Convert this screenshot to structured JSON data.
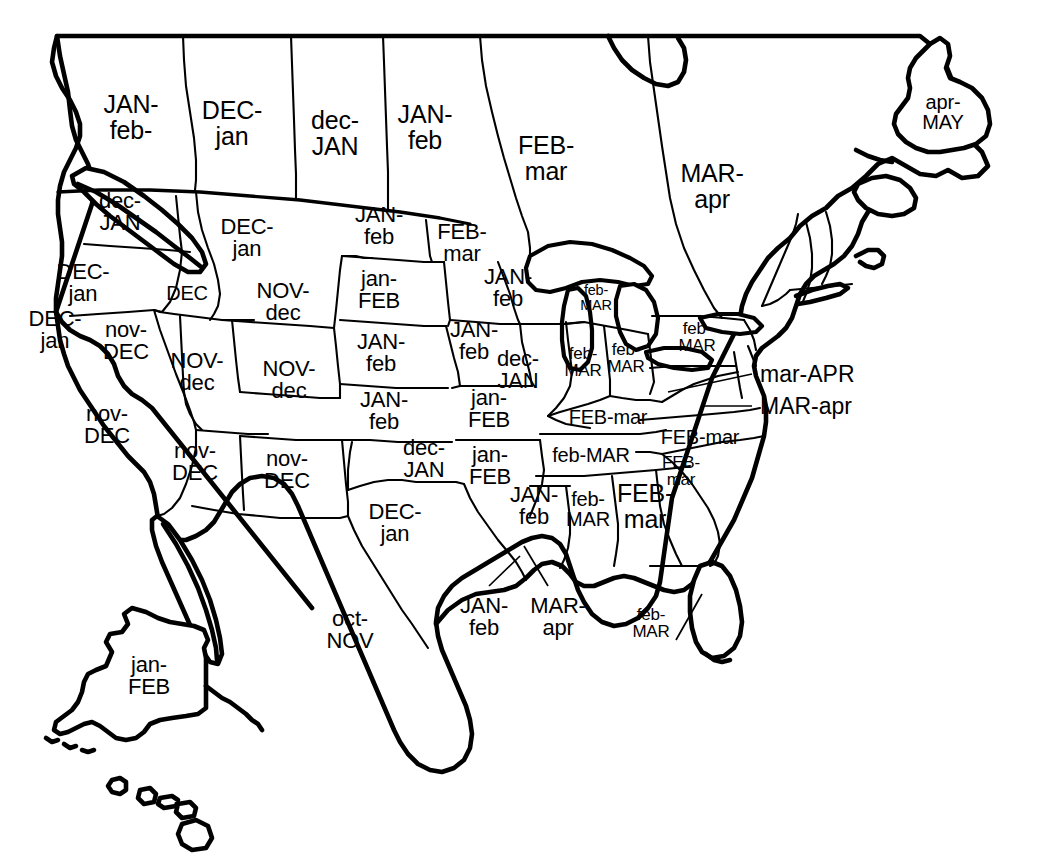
{
  "map": {
    "title": "North America Seasonal Month Map",
    "background_color": "#ffffff",
    "ink_color": "#000000",
    "width": 1044,
    "height": 865,
    "legend_note": "Uppercase month = primary period; lowercase month = secondary period"
  },
  "regions": [
    {
      "id": "british-columbia",
      "lines": [
        "JAN-",
        "feb-"
      ],
      "x": 131,
      "y": 117,
      "size": "sz-xl"
    },
    {
      "id": "alberta",
      "lines": [
        "DEC-",
        "jan"
      ],
      "x": 232,
      "y": 123,
      "size": "sz-xl"
    },
    {
      "id": "saskatchewan",
      "lines": [
        "dec-",
        "JAN"
      ],
      "x": 335,
      "y": 133,
      "size": "sz-xl"
    },
    {
      "id": "manitoba",
      "lines": [
        "JAN-",
        "feb"
      ],
      "x": 425,
      "y": 127,
      "size": "sz-xl"
    },
    {
      "id": "ontario",
      "lines": [
        "FEB-",
        "mar"
      ],
      "x": 546,
      "y": 158,
      "size": "sz-xl"
    },
    {
      "id": "quebec",
      "lines": [
        "MAR-",
        "apr"
      ],
      "x": 712,
      "y": 186,
      "size": "sz-xl"
    },
    {
      "id": "newfoundland",
      "lines": [
        "apr-",
        "MAY"
      ],
      "x": 943,
      "y": 112,
      "size": "sz-md"
    },
    {
      "id": "washington",
      "lines": [
        "dec-",
        "JAN"
      ],
      "x": 120,
      "y": 212,
      "size": "sz-lg"
    },
    {
      "id": "montana",
      "lines": [
        "DEC-",
        "jan"
      ],
      "x": 247,
      "y": 238,
      "size": "sz-lg"
    },
    {
      "id": "north-dakota",
      "lines": [
        "JAN-",
        "feb"
      ],
      "x": 379,
      "y": 226,
      "size": "sz-lg"
    },
    {
      "id": "minnesota",
      "lines": [
        "FEB-",
        "mar"
      ],
      "x": 462,
      "y": 243,
      "size": "sz-lg"
    },
    {
      "id": "oregon",
      "lines": [
        "DEC-",
        "jan"
      ],
      "x": 83,
      "y": 283,
      "size": "sz-lg"
    },
    {
      "id": "idaho-south",
      "lines": [
        "DEC"
      ],
      "x": 187,
      "y": 293,
      "size": "sz-md"
    },
    {
      "id": "south-dakota",
      "lines": [
        "jan-",
        "FEB"
      ],
      "x": 379,
      "y": 290,
      "size": "sz-lg"
    },
    {
      "id": "wisconsin",
      "lines": [
        "JAN-",
        "feb"
      ],
      "x": 508,
      "y": 288,
      "size": "sz-lg"
    },
    {
      "id": "michigan-upper",
      "lines": [
        "feb-",
        "MAR"
      ],
      "x": 596,
      "y": 298,
      "size": "sz-xs"
    },
    {
      "id": "wyoming",
      "lines": [
        "NOV-",
        "dec"
      ],
      "x": 283,
      "y": 302,
      "size": "sz-lg"
    },
    {
      "id": "california-north",
      "lines": [
        "DEC-",
        "jan"
      ],
      "x": 55,
      "y": 330,
      "size": "sz-lg"
    },
    {
      "id": "nevada",
      "lines": [
        "nov-",
        "DEC"
      ],
      "x": 126,
      "y": 341,
      "size": "sz-lg"
    },
    {
      "id": "nebraska",
      "lines": [
        "JAN-",
        "feb"
      ],
      "x": 381,
      "y": 353,
      "size": "sz-lg"
    },
    {
      "id": "iowa",
      "lines": [
        "JAN-",
        "feb"
      ],
      "x": 474,
      "y": 341,
      "size": "sz-lg"
    },
    {
      "id": "utah",
      "lines": [
        "NOV-",
        "dec"
      ],
      "x": 197,
      "y": 372,
      "size": "sz-lg"
    },
    {
      "id": "colorado",
      "lines": [
        "NOV-",
        "dec"
      ],
      "x": 289,
      "y": 380,
      "size": "sz-lg"
    },
    {
      "id": "illinois",
      "lines": [
        "dec-",
        "JAN"
      ],
      "x": 518,
      "y": 370,
      "size": "sz-lg"
    },
    {
      "id": "indiana",
      "lines": [
        "feb-",
        "MAR"
      ],
      "x": 583,
      "y": 362,
      "size": "sz-sm"
    },
    {
      "id": "ohio",
      "lines": [
        "feb-",
        "MAR"
      ],
      "x": 626,
      "y": 358,
      "size": "sz-sm"
    },
    {
      "id": "pennsylvania",
      "lines": [
        "feb-",
        "MAR"
      ],
      "x": 697,
      "y": 337,
      "size": "sz-sm"
    },
    {
      "id": "kansas",
      "lines": [
        "JAN-",
        "feb"
      ],
      "x": 384,
      "y": 411,
      "size": "sz-lg"
    },
    {
      "id": "missouri",
      "lines": [
        "jan-",
        "FEB"
      ],
      "x": 489,
      "y": 409,
      "size": "sz-lg"
    },
    {
      "id": "kentucky",
      "lines": [
        "FEB-mar"
      ],
      "x": 608,
      "y": 417,
      "size": "sz-md"
    },
    {
      "id": "arizona",
      "lines": [
        "nov-",
        "DEC"
      ],
      "x": 195,
      "y": 462,
      "size": "sz-lg"
    },
    {
      "id": "new-mexico",
      "lines": [
        "nov-",
        "DEC"
      ],
      "x": 287,
      "y": 470,
      "size": "sz-lg"
    },
    {
      "id": "oklahoma",
      "lines": [
        "dec-",
        "JAN"
      ],
      "x": 424,
      "y": 459,
      "size": "sz-lg"
    },
    {
      "id": "arkansas",
      "lines": [
        "jan-",
        "FEB"
      ],
      "x": 490,
      "y": 466,
      "size": "sz-lg"
    },
    {
      "id": "tennessee",
      "lines": [
        "feb-MAR"
      ],
      "x": 591,
      "y": 455,
      "size": "sz-md"
    },
    {
      "id": "north-carolina",
      "lines": [
        "FEB-mar"
      ],
      "x": 700,
      "y": 437,
      "size": "sz-md"
    },
    {
      "id": "south-carolina",
      "lines": [
        "FEB-",
        "mar"
      ],
      "x": 681,
      "y": 471,
      "size": "sz-sm"
    },
    {
      "id": "california-south",
      "lines": [
        "nov-",
        "DEC"
      ],
      "x": 107,
      "y": 425,
      "size": "sz-lg"
    },
    {
      "id": "texas",
      "lines": [
        "DEC-",
        "jan"
      ],
      "x": 395,
      "y": 523,
      "size": "sz-lg"
    },
    {
      "id": "louisiana",
      "lines": [
        "JAN-",
        "feb"
      ],
      "x": 534,
      "y": 506,
      "size": "sz-lg"
    },
    {
      "id": "mississippi",
      "lines": [
        "feb-",
        "MAR"
      ],
      "x": 588,
      "y": 509,
      "size": "sz-md"
    },
    {
      "id": "alabama",
      "lines": [
        "FEB-",
        "mar"
      ],
      "x": 645,
      "y": 506,
      "size": "sz-xl"
    },
    {
      "id": "mexico",
      "lines": [
        "oct-",
        "NOV"
      ],
      "x": 350,
      "y": 630,
      "size": "sz-lg"
    },
    {
      "id": "alaska",
      "lines": [
        "jan-",
        "FEB"
      ],
      "x": 149,
      "y": 676,
      "size": "sz-lg"
    }
  ],
  "callouts": [
    {
      "id": "maryland",
      "label": "mar-APR",
      "text_x": 760,
      "text_y": 374,
      "leader": "M 752 374 L 668 392"
    },
    {
      "id": "delaware",
      "label": "MAR-apr",
      "text_x": 760,
      "text_y": 406,
      "leader": "M 752 406 L 705 406"
    },
    {
      "id": "texas-gulf",
      "lines": [
        "JAN-",
        "feb"
      ],
      "label": "JAN-feb",
      "text_x": 484,
      "text_y": 618,
      "leader": "M 490 586 L 518 556"
    },
    {
      "id": "louisiana-gulf",
      "lines": [
        "MAR-",
        "apr"
      ],
      "label": "MAR-apr",
      "text_x": 556,
      "text_y": 618,
      "leader": "M 546 586 L 524 548"
    },
    {
      "id": "florida",
      "lines": [
        "feb-",
        "MAR"
      ],
      "label": "feb-MAR",
      "text_x": 651,
      "text_y": 623,
      "leader": "M 676 640 L 700 596"
    }
  ],
  "callout_stacked": [
    {
      "id": "texas-gulf-label",
      "lines": [
        "JAN-",
        "feb"
      ],
      "x": 484,
      "y": 617,
      "size": "sz-lg"
    },
    {
      "id": "louisiana-gulf-label",
      "lines": [
        "MAR-",
        "apr"
      ],
      "x": 558,
      "y": 617,
      "size": "sz-lg"
    },
    {
      "id": "florida-label",
      "lines": [
        "feb-",
        "MAR"
      ],
      "x": 651,
      "y": 623,
      "size": "sz-sm"
    }
  ],
  "inset_unlabeled": [
    {
      "id": "hawaii",
      "note": "Hawaiian islands, no month label"
    },
    {
      "id": "new-england",
      "note": "Vermont, New Hampshire, Maine outlines, no month label"
    }
  ]
}
